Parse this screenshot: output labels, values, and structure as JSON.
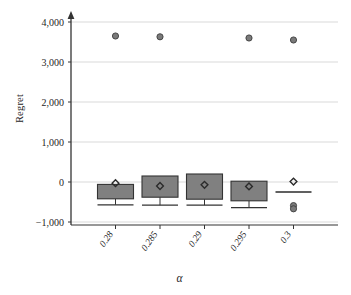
{
  "chart_data": {
    "type": "box",
    "title": "",
    "xlabel": "α",
    "ylabel": "Regret",
    "categories": [
      "0.28",
      "0.285",
      "0.29",
      "0.295",
      "0.3"
    ],
    "ylim": [
      -1000,
      4000
    ],
    "xlim": [
      0,
      6
    ],
    "yticks": [
      -1000,
      0,
      1000,
      2000,
      3000,
      4000
    ],
    "ytick_labels": [
      "−1,000",
      "0",
      "1,000",
      "2,000",
      "3,000",
      "4,000"
    ],
    "grid": "horizontal",
    "legend": "none",
    "boxes": [
      {
        "category": "0.28",
        "whisker_low": -570,
        "q1": -420,
        "median": -60,
        "q3": -60,
        "whisker_high": -60,
        "mean": -30,
        "outliers": [
          3650
        ]
      },
      {
        "category": "0.285",
        "whisker_low": -580,
        "q1": -380,
        "median": -100,
        "q3": 150,
        "whisker_high": 150,
        "mean": -100,
        "outliers": [
          3630
        ]
      },
      {
        "category": "0.29",
        "whisker_low": -580,
        "q1": -430,
        "median": -70,
        "q3": 200,
        "whisker_high": 200,
        "mean": -70,
        "outliers": []
      },
      {
        "category": "0.295",
        "whisker_low": -640,
        "q1": -470,
        "median": -110,
        "q3": 20,
        "whisker_high": 20,
        "mean": -110,
        "outliers": [
          3600
        ]
      },
      {
        "category": "0.3",
        "whisker_low": -250,
        "q1": -250,
        "median": -250,
        "q3": -250,
        "whisker_high": -250,
        "mean": 10,
        "outliers": [
          3550,
          -590,
          -670
        ]
      }
    ],
    "colors": {
      "box_fill": "#808080",
      "box_edge": "#333333",
      "grid": "#d9d9d9",
      "axis": "#333333",
      "outlier_fill": "#7a7a7a",
      "text": "#262626",
      "background": "#ffffff"
    }
  }
}
